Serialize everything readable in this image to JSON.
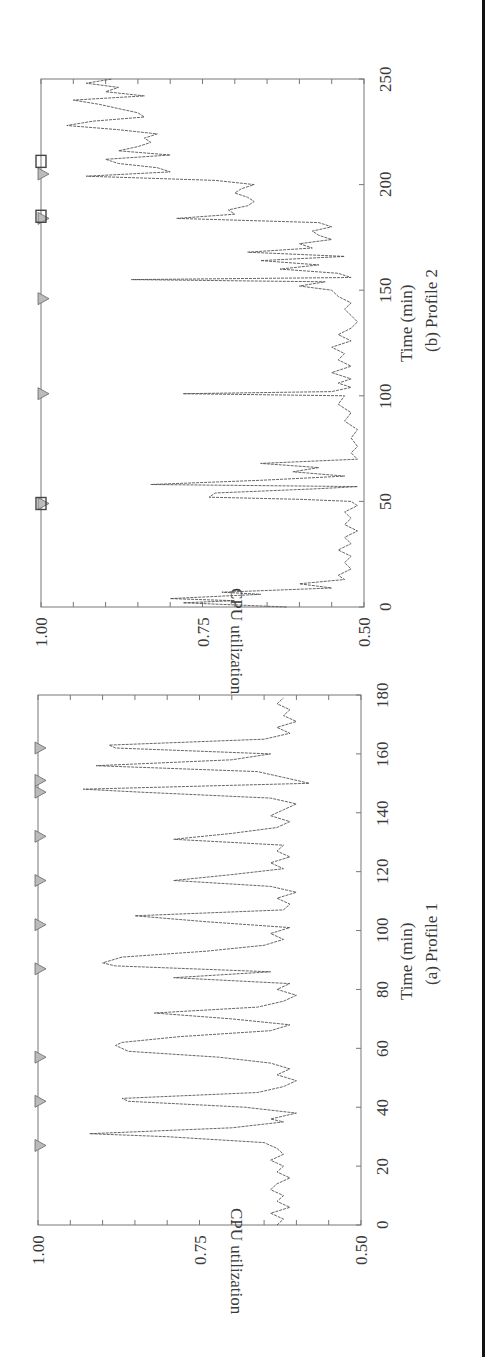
{
  "figure": {
    "orientation": "rotated-90-ccw",
    "page_edge_color": "#111111",
    "line_color": "#555555",
    "frame_color": "#777777"
  },
  "chart_data": [
    {
      "id": "profile1",
      "type": "line",
      "title": "(a) Profile 1",
      "xlabel": "Time (min)",
      "ylabel": "CPU utilization",
      "xlim": [
        0,
        180
      ],
      "ylim": [
        0.5,
        1.0
      ],
      "xticks": [
        "0",
        "20",
        "40",
        "60",
        "80",
        "100",
        "120",
        "140",
        "160",
        "180"
      ],
      "yticks": [
        "0.50",
        "0.75",
        "1.00"
      ],
      "grid": false,
      "markers": {
        "type": "triangle",
        "at_cpu": 1.0,
        "x": [
          27,
          42,
          57,
          87,
          102,
          117,
          132,
          147,
          151,
          162
        ]
      },
      "series": [
        {
          "name": "CPU utilization",
          "x": [
            0,
            2,
            4,
            6,
            8,
            10,
            12,
            14,
            16,
            18,
            20,
            22,
            24,
            26,
            28,
            30,
            31,
            33,
            35,
            36,
            38,
            40,
            42,
            43,
            45,
            47,
            49,
            51,
            53,
            55,
            57,
            59,
            61,
            62,
            64,
            66,
            68,
            70,
            72,
            74,
            76,
            78,
            80,
            82,
            84,
            86,
            88,
            89,
            91,
            93,
            95,
            97,
            99,
            101,
            103,
            105,
            107,
            109,
            111,
            113,
            115,
            117,
            119,
            121,
            123,
            125,
            127,
            129,
            131,
            133,
            135,
            137,
            139,
            141,
            143,
            145,
            147,
            148,
            150,
            152,
            154,
            156,
            158,
            160,
            162,
            163,
            165,
            167,
            169,
            171,
            173,
            175,
            177,
            179
          ],
          "y": [
            0.63,
            0.62,
            0.64,
            0.61,
            0.63,
            0.62,
            0.64,
            0.63,
            0.61,
            0.63,
            0.62,
            0.64,
            0.62,
            0.63,
            0.65,
            0.8,
            0.92,
            0.7,
            0.62,
            0.64,
            0.6,
            0.68,
            0.86,
            0.87,
            0.66,
            0.62,
            0.6,
            0.63,
            0.61,
            0.64,
            0.72,
            0.86,
            0.88,
            0.87,
            0.78,
            0.64,
            0.61,
            0.7,
            0.82,
            0.66,
            0.62,
            0.6,
            0.63,
            0.61,
            0.79,
            0.64,
            0.88,
            0.9,
            0.87,
            0.74,
            0.65,
            0.62,
            0.64,
            0.61,
            0.74,
            0.85,
            0.62,
            0.61,
            0.63,
            0.6,
            0.64,
            0.79,
            0.7,
            0.62,
            0.64,
            0.61,
            0.63,
            0.62,
            0.79,
            0.7,
            0.63,
            0.61,
            0.64,
            0.62,
            0.6,
            0.64,
            0.84,
            0.93,
            0.58,
            0.62,
            0.66,
            0.91,
            0.7,
            0.64,
            0.88,
            0.89,
            0.65,
            0.61,
            0.63,
            0.6,
            0.62,
            0.61,
            0.63,
            0.62
          ]
        }
      ]
    },
    {
      "id": "profile2",
      "type": "line",
      "title": "(b) Profile 2",
      "xlabel": "Time (min)",
      "ylabel": "CPU utilization",
      "xlim": [
        0,
        250
      ],
      "ylim": [
        0.5,
        1.0
      ],
      "xticks": [
        "0",
        "50",
        "100",
        "150",
        "200",
        "250"
      ],
      "yticks": [
        "0.50",
        "0.75",
        "1.00"
      ],
      "grid": false,
      "markers": [
        {
          "type": "triangle",
          "at_cpu": 1.0,
          "x": [
            49,
            101,
            146,
            184,
            205
          ]
        },
        {
          "type": "square",
          "at_cpu": 1.0,
          "x": [
            49,
            185,
            211
          ]
        }
      ],
      "series": [
        {
          "name": "CPU utilization",
          "x": [
            0,
            2,
            3,
            4,
            6,
            7,
            9,
            11,
            13,
            15,
            18,
            21,
            24,
            27,
            30,
            33,
            36,
            39,
            42,
            45,
            48,
            50,
            51,
            52,
            54,
            56,
            57,
            58,
            60,
            62,
            64,
            66,
            68,
            70,
            73,
            76,
            80,
            84,
            88,
            92,
            96,
            100,
            101,
            102,
            104,
            106,
            108,
            111,
            114,
            117,
            120,
            123,
            126,
            129,
            132,
            135,
            138,
            141,
            144,
            147,
            150,
            152,
            154,
            155,
            156,
            158,
            160,
            162,
            164,
            166,
            168,
            170,
            172,
            174,
            176,
            178,
            180,
            182,
            184,
            186,
            188,
            190,
            192,
            194,
            196,
            198,
            200,
            202,
            204,
            206,
            208,
            210,
            212,
            214,
            216,
            218,
            220,
            222,
            224,
            226,
            228,
            230,
            232,
            234,
            236,
            238,
            240,
            242,
            244,
            246,
            248,
            250
          ],
          "y": [
            0.62,
            0.78,
            0.7,
            0.8,
            0.66,
            0.72,
            0.55,
            0.6,
            0.53,
            0.54,
            0.52,
            0.53,
            0.52,
            0.54,
            0.52,
            0.53,
            0.51,
            0.53,
            0.52,
            0.53,
            0.51,
            0.52,
            0.6,
            0.74,
            0.73,
            0.57,
            0.51,
            0.83,
            0.66,
            0.53,
            0.61,
            0.57,
            0.66,
            0.51,
            0.52,
            0.51,
            0.52,
            0.51,
            0.53,
            0.52,
            0.54,
            0.53,
            0.78,
            0.55,
            0.52,
            0.54,
            0.52,
            0.55,
            0.52,
            0.54,
            0.53,
            0.55,
            0.52,
            0.54,
            0.52,
            0.51,
            0.52,
            0.53,
            0.52,
            0.54,
            0.55,
            0.6,
            0.56,
            0.86,
            0.52,
            0.54,
            0.63,
            0.57,
            0.66,
            0.53,
            0.68,
            0.58,
            0.6,
            0.55,
            0.57,
            0.58,
            0.55,
            0.57,
            0.79,
            0.7,
            0.71,
            0.68,
            0.67,
            0.68,
            0.7,
            0.69,
            0.67,
            0.73,
            0.93,
            0.8,
            0.82,
            0.88,
            0.9,
            0.8,
            0.88,
            0.85,
            0.83,
            0.84,
            0.82,
            0.88,
            0.96,
            0.92,
            0.84,
            0.85,
            0.88,
            0.91,
            0.95,
            0.84,
            0.9,
            0.88,
            0.93,
            0.89
          ]
        }
      ]
    }
  ],
  "labels": {
    "p2_ylabel": "CPU utilization",
    "p2_xlabel": "Time (min)",
    "p2_caption": "(b) Profile 2",
    "p1_ylabel": "CPU utilization",
    "p1_xlabel": "Time (min)",
    "p1_caption": "(a) Profile 1"
  }
}
